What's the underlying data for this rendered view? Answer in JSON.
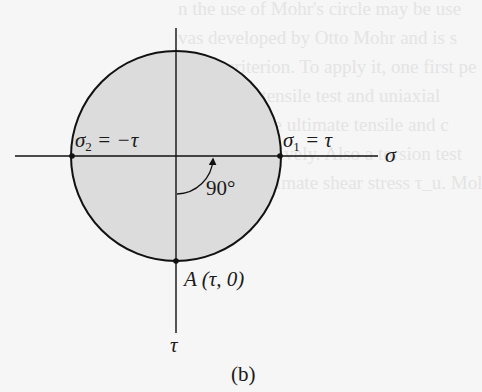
{
  "figure": {
    "caption": "(b)",
    "axes": {
      "horizontal_label": "σ",
      "vertical_label": "τ"
    },
    "labels": {
      "sigma2": {
        "symbol": "σ",
        "sub": "2",
        "rest": " = −τ"
      },
      "sigma1": {
        "symbol": "σ",
        "sub": "1",
        "rest": " = τ"
      },
      "angle": "90°",
      "point_a": {
        "name": "A",
        "coords": " (τ, 0)"
      }
    },
    "colors": {
      "circle_fill": "#dcdcdc",
      "line": "#111111",
      "background": "#f6f6f6"
    }
  },
  "bleed_through_text": [
    "n the use of Mohr's circle may be use",
    "vas developed by Otto Mohr and is s",
    "ailure criterion. To apply it, one first pe",
    "A uniaxial tensile test and uniaxial",
    "determine the ultimate tensile and c",
    "σ_uc, respectively. Also a torsion test",
    "material's ultimate shear stress τ_u. Mol"
  ]
}
